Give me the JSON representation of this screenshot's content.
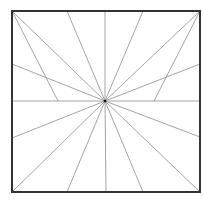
{
  "diagram": {
    "type": "radial-line-pattern",
    "background": "#ffffff",
    "frame": {
      "x": 12,
      "y": 11,
      "width": 188,
      "height": 181,
      "stroke": "#333333",
      "stroke_width": 2
    },
    "center": {
      "x": 105,
      "y": 101,
      "dot_color": "#111111",
      "dot_radius": 1.3
    },
    "line_color": "#9a9a9a",
    "line_width": 0.9,
    "rays": [
      {
        "to": [
          12,
          11
        ]
      },
      {
        "to": [
          67,
          11
        ]
      },
      {
        "to": [
          105,
          11
        ]
      },
      {
        "to": [
          143,
          11
        ]
      },
      {
        "to": [
          200,
          11
        ]
      },
      {
        "to": [
          200,
          64
        ]
      },
      {
        "to": [
          200,
          101
        ]
      },
      {
        "to": [
          200,
          137
        ]
      },
      {
        "to": [
          200,
          192
        ]
      },
      {
        "to": [
          143,
          192
        ]
      },
      {
        "to": [
          106,
          192
        ]
      },
      {
        "to": [
          67,
          192
        ]
      },
      {
        "to": [
          12,
          192
        ]
      },
      {
        "to": [
          12,
          138
        ]
      },
      {
        "to": [
          12,
          101
        ]
      },
      {
        "to": [
          12,
          64
        ]
      }
    ],
    "extra_segments": [
      {
        "from": [
          12,
          11
        ],
        "to": [
          58,
          101
        ]
      },
      {
        "from": [
          200,
          11
        ],
        "to": [
          154,
          101
        ]
      }
    ]
  }
}
